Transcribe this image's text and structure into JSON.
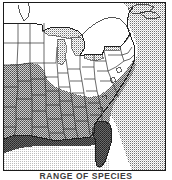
{
  "figure": {
    "caption": "RANGE OF SPECIES",
    "frame_color": "#1a1a1a",
    "background_color": "#ffffff"
  },
  "map": {
    "region": "Eastern and Southern United States",
    "projection_note": "conic, eastern half of contiguous U.S. with Gulf of Mexico and western Atlantic",
    "legend_classes": [
      {
        "name": "outside-range",
        "label": "Unshaded (northern states)",
        "fill": "#ffffff",
        "pattern": "none"
      },
      {
        "name": "range-core",
        "label": "Medium stipple (southern interior)",
        "fill": "#8a8a8a",
        "pattern": "halftone-medium"
      },
      {
        "name": "range-dense",
        "label": "Dark stipple (Gulf Coast and Florida)",
        "fill": "#555555",
        "pattern": "halftone-dense"
      },
      {
        "name": "water-ocean",
        "label": "Light stipple (Atlantic Ocean / Great Lakes)",
        "fill": "#c9c9c9",
        "pattern": "halftone-light"
      },
      {
        "name": "water-gulf",
        "label": "Very light stipple (Gulf of Mexico)",
        "fill": "#e6e6e6",
        "pattern": "halftone-faint"
      }
    ],
    "features": {
      "states_outlined": true,
      "coastline_outlined": true,
      "great_lakes_shaded": true,
      "international_border_shown": true
    }
  },
  "colors": {
    "ink": "#1a1a1a",
    "line": "#2b2b2b",
    "range_core": "#8a8a8a",
    "range_dense": "#555555",
    "ocean": "#c9c9c9",
    "gulf": "#e6e6e6",
    "land": "#ffffff"
  }
}
